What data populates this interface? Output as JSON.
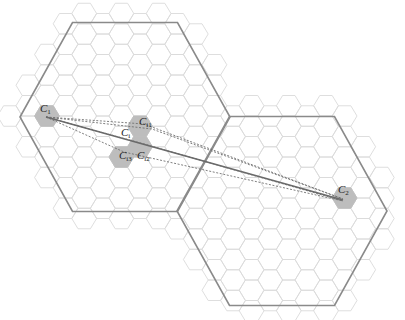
{
  "figure": {
    "width": 405,
    "height": 320,
    "colors": {
      "grid_stroke": "#dadada",
      "highlight_fill": "#bdbdbd",
      "big_cell_stroke": "#8a8a8a",
      "solid_link": "#6a6a6a",
      "dotted_link": "#707070",
      "label": "#222222"
    }
  },
  "small_grid": {
    "origin": [
      47,
      116
    ],
    "col_spacing": 18.6,
    "row_spacing": 20.5,
    "radius_x": 12.4,
    "radius_y": 10.25,
    "col_range": [
      -2,
      19
    ],
    "row_range": [
      -6,
      10
    ]
  },
  "big_cells": [
    {
      "name": "macro-cell-1",
      "center": [
        125,
        117
      ],
      "rx": 105,
      "ry": 94.5
    },
    {
      "name": "macro-cell-2",
      "center": [
        282,
        211
      ],
      "rx": 105,
      "ry": 94.5
    }
  ],
  "grid_margin_scale": 1.13,
  "highlighted_cells": [
    {
      "id": "C1",
      "col": 0,
      "row": 0
    },
    {
      "id": "Ci1",
      "col": 5,
      "row": 0
    },
    {
      "id": "Ci2",
      "col": 5,
      "row": 1
    },
    {
      "id": "Ci3",
      "col": 4,
      "row": 2
    },
    {
      "id": "C2",
      "col": 16,
      "row": 4
    }
  ],
  "labels": [
    {
      "id": "C1",
      "base": "C",
      "sub": "1",
      "x": 40,
      "y": 112
    },
    {
      "id": "Ci1",
      "base": "C",
      "sub": "i1",
      "x": 139,
      "y": 125
    },
    {
      "id": "Ci",
      "base": "C",
      "sub": "i",
      "x": 121,
      "y": 136
    },
    {
      "id": "Ci3",
      "base": "C",
      "sub": "i3",
      "x": 119,
      "y": 159
    },
    {
      "id": "Ci2",
      "base": "C",
      "sub": "i2",
      "x": 137,
      "y": 159
    },
    {
      "id": "C2",
      "base": "C",
      "sub": "2",
      "x": 338,
      "y": 193
    }
  ],
  "links": {
    "solid": [
      {
        "from": [
          46,
          117
        ],
        "to": [
          343,
          200
        ]
      }
    ],
    "dotted": [
      {
        "from": [
          46,
          117
        ],
        "to": [
          343,
          199
        ],
        "via": [
          144,
          124
        ]
      },
      {
        "from": [
          46,
          117
        ],
        "to": [
          343,
          199
        ],
        "via": [
          152,
          129
        ]
      },
      {
        "from": [
          46,
          117
        ],
        "to": [
          343,
          201
        ],
        "via": [
          144,
          144
        ]
      },
      {
        "from": [
          46,
          117
        ],
        "to": [
          343,
          201
        ],
        "via": [
          124,
          152
        ]
      }
    ]
  }
}
